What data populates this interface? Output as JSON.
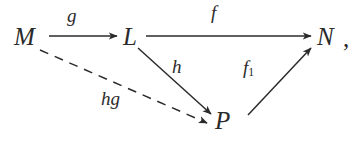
{
  "diagram": {
    "type": "commutative-diagram",
    "background_color": "#ffffff",
    "ink_color": "#2b2b2b",
    "trailing_punctuation": ",",
    "nodes": [
      {
        "id": "M",
        "label": "M",
        "x": 26,
        "y": 36
      },
      {
        "id": "L",
        "label": "L",
        "x": 133,
        "y": 36
      },
      {
        "id": "N",
        "label": "N",
        "x": 327,
        "y": 36
      },
      {
        "id": "P",
        "label": "P",
        "x": 225,
        "y": 121
      }
    ],
    "edges": [
      {
        "id": "M-to-L",
        "from": "M",
        "to": "L",
        "label": "g",
        "style": "solid",
        "arrowhead": "end",
        "path": {
          "x1": 49,
          "y1": 36,
          "x2": 117,
          "y2": 36
        }
      },
      {
        "id": "L-to-N",
        "from": "L",
        "to": "N",
        "label": "f",
        "style": "solid",
        "arrowhead": "end",
        "path": {
          "x1": 146,
          "y1": 36,
          "x2": 311,
          "y2": 36
        }
      },
      {
        "id": "L-to-P",
        "from": "L",
        "to": "P",
        "label": "h",
        "style": "solid",
        "arrowhead": "end",
        "path": {
          "x1": 138,
          "y1": 48,
          "x2": 211,
          "y2": 116
        }
      },
      {
        "id": "P-to-N",
        "from": "P",
        "to": "N",
        "label": "f1",
        "label_base": "f",
        "label_subscript": "1",
        "style": "solid",
        "arrowhead": "end",
        "path": {
          "x1": 248,
          "y1": 115,
          "x2": 311,
          "y2": 48
        }
      },
      {
        "id": "M-to-P",
        "from": "M",
        "to": "P",
        "label": "hg",
        "style": "dashed",
        "arrowhead": "end",
        "dash_pattern": "9 7",
        "path": {
          "x1": 40,
          "y1": 50,
          "x2": 209,
          "y2": 124
        }
      }
    ],
    "labels": {
      "g": "g",
      "f": "f",
      "h": "h",
      "f1_base": "f",
      "f1_sub": "1",
      "hg": "hg"
    }
  }
}
